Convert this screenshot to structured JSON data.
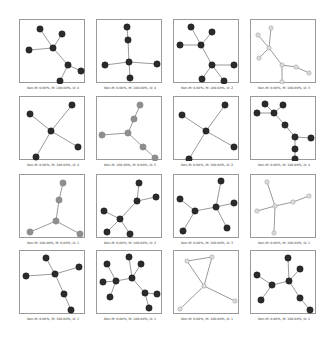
{
  "figure": {
    "layout": {
      "rows": 4,
      "cols": 4
    },
    "colors": {
      "dark_node": "#2b2b2b",
      "grey_node": "#8e8e8e",
      "light_node": "#dcdcdc",
      "edge": "#555555",
      "frame": "#9a9a9a"
    },
    "panels": [
      {
        "label": "Non-M: 0.00%, M: 100.00%, O: 4",
        "style": "dark",
        "nodes": [
          [
            20,
            9
          ],
          [
            42,
            14
          ],
          [
            9,
            30
          ],
          [
            33,
            28
          ],
          [
            48,
            45
          ],
          [
            61,
            51
          ],
          [
            40,
            61
          ]
        ],
        "edges": [
          [
            0,
            3
          ],
          [
            1,
            3
          ],
          [
            2,
            3
          ],
          [
            3,
            4
          ],
          [
            4,
            5
          ],
          [
            4,
            6
          ]
        ]
      },
      {
        "label": "Non-M: 0.00%, M: 100.00%, O: 4",
        "style": "dark",
        "nodes": [
          [
            30,
            7
          ],
          [
            31,
            20
          ],
          [
            32,
            42
          ],
          [
            8,
            45
          ],
          [
            60,
            44
          ],
          [
            33,
            58
          ]
        ],
        "edges": [
          [
            0,
            1
          ],
          [
            1,
            2
          ],
          [
            2,
            3
          ],
          [
            2,
            4
          ],
          [
            2,
            5
          ]
        ]
      },
      {
        "label": "Non-M: 0.00%, M: 100.00%, O: 2",
        "style": "dark",
        "nodes": [
          [
            17,
            7
          ],
          [
            38,
            12
          ],
          [
            6,
            25
          ],
          [
            27,
            25
          ],
          [
            38,
            45
          ],
          [
            60,
            45
          ],
          [
            28,
            59
          ],
          [
            50,
            61
          ]
        ],
        "edges": [
          [
            0,
            3
          ],
          [
            1,
            3
          ],
          [
            2,
            3
          ],
          [
            3,
            4
          ],
          [
            4,
            5
          ],
          [
            4,
            6
          ],
          [
            4,
            7
          ]
        ]
      },
      {
        "label": "Non-M: 0.00%, M: 100.00%, O: 3",
        "style": "light",
        "nodes": [
          [
            20,
            8
          ],
          [
            7,
            15
          ],
          [
            18,
            28
          ],
          [
            8,
            38
          ],
          [
            31,
            45
          ],
          [
            45,
            47
          ],
          [
            58,
            53
          ],
          [
            31,
            62
          ]
        ],
        "edges": [
          [
            0,
            2
          ],
          [
            1,
            2
          ],
          [
            2,
            3
          ],
          [
            2,
            4
          ],
          [
            4,
            5
          ],
          [
            5,
            6
          ],
          [
            4,
            7
          ]
        ]
      },
      {
        "label": "Non-M: 0.00%, M: 100.00%, O: 4",
        "style": "dark",
        "nodes": [
          [
            52,
            8
          ],
          [
            10,
            17
          ],
          [
            31,
            34
          ],
          [
            58,
            50
          ],
          [
            16,
            60
          ]
        ],
        "edges": [
          [
            0,
            2
          ],
          [
            1,
            2
          ],
          [
            2,
            3
          ],
          [
            2,
            4
          ]
        ]
      },
      {
        "label": "Non-M: 100.00%, M: 0.00%, O: 5",
        "style": "grey",
        "nodes": [
          [
            43,
            8
          ],
          [
            37,
            22
          ],
          [
            31,
            36
          ],
          [
            5,
            38
          ],
          [
            46,
            50
          ],
          [
            58,
            61
          ]
        ],
        "edges": [
          [
            0,
            1
          ],
          [
            1,
            2
          ],
          [
            2,
            3
          ],
          [
            2,
            4
          ],
          [
            4,
            5
          ]
        ]
      },
      {
        "label": "Non-M: 0.00%, M: 100.00%, O: 2",
        "style": "dark",
        "nodes": [
          [
            51,
            8
          ],
          [
            8,
            18
          ],
          [
            32,
            34
          ],
          [
            60,
            50
          ],
          [
            15,
            62
          ]
        ],
        "edges": [
          [
            0,
            2
          ],
          [
            1,
            2
          ],
          [
            2,
            3
          ],
          [
            2,
            4
          ]
        ]
      },
      {
        "label": "Non-M: 0.00%, M: 100.00%, O: 4",
        "style": "dark",
        "nodes": [
          [
            14,
            7
          ],
          [
            32,
            8
          ],
          [
            6,
            16
          ],
          [
            23,
            16
          ],
          [
            34,
            28
          ],
          [
            44,
            40
          ],
          [
            60,
            41
          ],
          [
            44,
            52
          ],
          [
            44,
            62
          ]
        ],
        "edges": [
          [
            0,
            3
          ],
          [
            1,
            3
          ],
          [
            2,
            3
          ],
          [
            3,
            4
          ],
          [
            4,
            5
          ],
          [
            5,
            6
          ],
          [
            5,
            7
          ],
          [
            7,
            8
          ]
        ]
      },
      {
        "label": "Non-M: 100.00%, M: 0.00%, O: 1",
        "style": "grey",
        "nodes": [
          [
            43,
            8
          ],
          [
            39,
            25
          ],
          [
            36,
            46
          ],
          [
            10,
            57
          ],
          [
            60,
            59
          ]
        ],
        "edges": [
          [
            0,
            1
          ],
          [
            1,
            2
          ],
          [
            2,
            3
          ],
          [
            2,
            4
          ]
        ]
      },
      {
        "label": "Non-M: 0.00%, M: 100.00%, O: 2",
        "style": "dark",
        "nodes": [
          [
            42,
            8
          ],
          [
            59,
            22
          ],
          [
            40,
            26
          ],
          [
            7,
            36
          ],
          [
            23,
            44
          ],
          [
            10,
            57
          ],
          [
            33,
            59
          ]
        ],
        "edges": [
          [
            0,
            2
          ],
          [
            1,
            2
          ],
          [
            2,
            4
          ],
          [
            3,
            4
          ],
          [
            4,
            5
          ],
          [
            4,
            6
          ]
        ]
      },
      {
        "label": "Non-M: 0.00%, M: 100.00%, O: 3",
        "style": "dark",
        "nodes": [
          [
            47,
            6
          ],
          [
            6,
            24
          ],
          [
            21,
            36
          ],
          [
            42,
            32
          ],
          [
            60,
            28
          ],
          [
            9,
            56
          ],
          [
            53,
            53
          ]
        ],
        "edges": [
          [
            0,
            3
          ],
          [
            1,
            2
          ],
          [
            2,
            3
          ],
          [
            3,
            4
          ],
          [
            2,
            5
          ],
          [
            3,
            6
          ]
        ]
      },
      {
        "label": "Non-M: 0.00%, M: 100.00%, O: 1",
        "style": "light",
        "nodes": [
          [
            16,
            7
          ],
          [
            24,
            31
          ],
          [
            42,
            27
          ],
          [
            58,
            21
          ],
          [
            6,
            36
          ],
          [
            23,
            58
          ]
        ],
        "edges": [
          [
            0,
            1
          ],
          [
            1,
            2
          ],
          [
            2,
            3
          ],
          [
            4,
            1
          ],
          [
            1,
            5
          ]
        ]
      },
      {
        "label": "Non-M: 0.00%, M: 100.00%, O: 1",
        "style": "dark",
        "nodes": [
          [
            26,
            7
          ],
          [
            59,
            16
          ],
          [
            6,
            25
          ],
          [
            35,
            23
          ],
          [
            44,
            43
          ],
          [
            51,
            59
          ]
        ],
        "edges": [
          [
            0,
            3
          ],
          [
            1,
            3
          ],
          [
            2,
            3
          ],
          [
            3,
            4
          ],
          [
            4,
            5
          ]
        ]
      },
      {
        "label": "Non-M: 0.00%, M: 100.00%, O: 1",
        "style": "dark",
        "nodes": [
          [
            32,
            6
          ],
          [
            10,
            13
          ],
          [
            44,
            13
          ],
          [
            6,
            31
          ],
          [
            19,
            30
          ],
          [
            35,
            27
          ],
          [
            48,
            42
          ],
          [
            60,
            43
          ],
          [
            13,
            46
          ],
          [
            52,
            57
          ]
        ],
        "edges": [
          [
            0,
            5
          ],
          [
            2,
            5
          ],
          [
            4,
            5
          ],
          [
            1,
            4
          ],
          [
            3,
            4
          ],
          [
            4,
            8
          ],
          [
            5,
            6
          ],
          [
            6,
            7
          ],
          [
            6,
            9
          ]
        ]
      },
      {
        "label": "Non-M: 0.00%, M: 100.00%, O: 1",
        "style": "light",
        "nodes": [
          [
            13,
            10
          ],
          [
            38,
            6
          ],
          [
            30,
            35
          ],
          [
            61,
            50
          ],
          [
            6,
            58
          ]
        ],
        "edges": [
          [
            0,
            1
          ],
          [
            0,
            2
          ],
          [
            1,
            2
          ],
          [
            2,
            3
          ],
          [
            2,
            4
          ]
        ]
      },
      {
        "label": "Non-M: 0.00%, M: 100.00%, O: 1",
        "style": "dark",
        "nodes": [
          [
            37,
            7
          ],
          [
            49,
            18
          ],
          [
            6,
            24
          ],
          [
            21,
            34
          ],
          [
            38,
            30
          ],
          [
            10,
            49
          ],
          [
            49,
            47
          ],
          [
            59,
            59
          ]
        ],
        "edges": [
          [
            0,
            4
          ],
          [
            1,
            4
          ],
          [
            2,
            3
          ],
          [
            3,
            4
          ],
          [
            3,
            5
          ],
          [
            4,
            6
          ],
          [
            6,
            7
          ]
        ]
      }
    ]
  }
}
